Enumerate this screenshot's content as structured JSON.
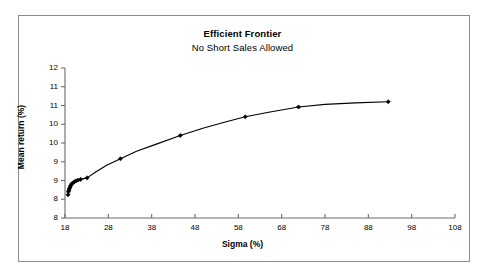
{
  "chart_data": {
    "type": "line",
    "title": "Efficient Frontier",
    "subtitle": "No Short Sales Allowed",
    "xlabel": "Sigma (%)",
    "ylabel": "Mean return (%)",
    "xlim": [
      18,
      108
    ],
    "ylim": [
      8,
      12
    ],
    "grid": false,
    "legend": null,
    "xticks": [
      18,
      28,
      38,
      48,
      58,
      68,
      78,
      88,
      98,
      108
    ],
    "xtick_labels": [
      "18",
      "28",
      "38",
      "48",
      "58",
      "68",
      "78",
      "88",
      "98",
      "108"
    ],
    "yticks": [
      8,
      8.5,
      9,
      9.5,
      10,
      10.5,
      11,
      11.5,
      12
    ],
    "ytick_labels": [
      "8",
      "9",
      "9",
      "10",
      "10",
      "11",
      "11",
      "12"
    ],
    "ytick_values_labeled": [
      8.5,
      9,
      9.5,
      10,
      10.5,
      11,
      11.5,
      12
    ],
    "marker": "diamond",
    "line_color": "#000000",
    "marker_color": "#000000",
    "series": [
      {
        "name": "Efficient Frontier",
        "x": [
          18.7,
          18.75,
          18.8,
          18.9,
          19.0,
          19.15,
          19.3,
          19.5,
          19.75,
          20.1,
          20.5,
          21.0,
          21.6,
          22.3,
          23.1,
          25.0,
          27.5,
          30.8,
          34.5,
          38.6,
          44.6,
          50.0,
          55.0,
          59.6,
          65.0,
          71.9,
          78.0,
          85.0,
          92.6
        ],
        "y": [
          8.62,
          8.66,
          8.7,
          8.74,
          8.78,
          8.82,
          8.86,
          8.9,
          8.93,
          8.96,
          8.99,
          9.01,
          9.03,
          9.05,
          9.07,
          9.22,
          9.4,
          9.58,
          9.78,
          9.95,
          10.2,
          10.4,
          10.56,
          10.7,
          10.82,
          10.96,
          11.03,
          11.07,
          11.1
        ]
      }
    ],
    "markers": [
      {
        "x": 18.7,
        "y": 8.62
      },
      {
        "x": 18.8,
        "y": 8.7
      },
      {
        "x": 18.9,
        "y": 8.74
      },
      {
        "x": 19.0,
        "y": 8.78
      },
      {
        "x": 19.15,
        "y": 8.82
      },
      {
        "x": 19.3,
        "y": 8.86
      },
      {
        "x": 19.5,
        "y": 8.9
      },
      {
        "x": 19.75,
        "y": 8.93
      },
      {
        "x": 20.1,
        "y": 8.96
      },
      {
        "x": 20.5,
        "y": 8.99
      },
      {
        "x": 21.0,
        "y": 9.01
      },
      {
        "x": 21.6,
        "y": 9.03
      },
      {
        "x": 23.1,
        "y": 9.07
      },
      {
        "x": 30.8,
        "y": 9.58
      },
      {
        "x": 44.6,
        "y": 10.2
      },
      {
        "x": 59.6,
        "y": 10.7
      },
      {
        "x": 71.9,
        "y": 10.96
      },
      {
        "x": 92.6,
        "y": 11.1
      }
    ]
  }
}
